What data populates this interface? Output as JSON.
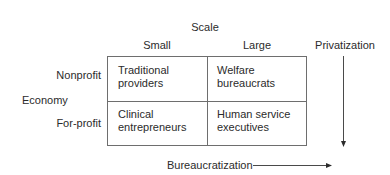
{
  "diagram": {
    "axis_top_title": "Scale",
    "column_headers": [
      "Small",
      "Large"
    ],
    "axis_left_title": "Economy",
    "row_headers": [
      "Nonprofit",
      "For-profit"
    ],
    "cells": [
      {
        "row": "Nonprofit",
        "col": "Small",
        "line1": "Traditional",
        "line2": "providers"
      },
      {
        "row": "Nonprofit",
        "col": "Large",
        "line1": "Welfare",
        "line2": "bureaucrats"
      },
      {
        "row": "For-profit",
        "col": "Small",
        "line1": "Clinical",
        "line2": "entrepreneurs"
      },
      {
        "row": "For-profit",
        "col": "Large",
        "line1": "Human service",
        "line2": "executives"
      }
    ],
    "vertical_arrow_label": "Privatization",
    "horizontal_arrow_label": "Bureaucratization",
    "line_color": "#6e6e6e",
    "text_color": "#2b2b2b"
  }
}
